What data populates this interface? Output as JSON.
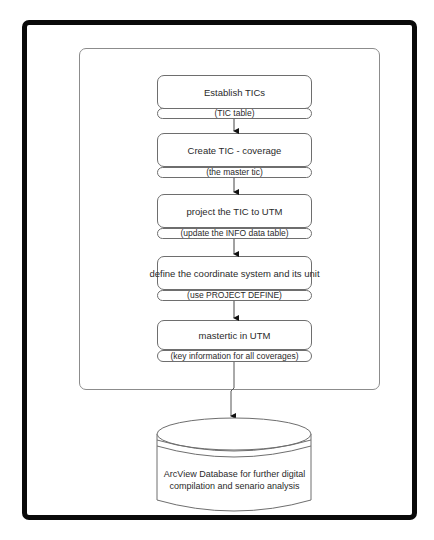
{
  "diagram": {
    "type": "flowchart",
    "steps": [
      {
        "title": "Establish TICs",
        "label": "(TIC table)"
      },
      {
        "title": "Create TIC - coverage",
        "label": "(the master tic)"
      },
      {
        "title": "project  the TIC to UTM",
        "label": "(update the INFO data table)"
      },
      {
        "title": "define the coordinate system  and its unit",
        "label": "(use PROJECT DEFINE)"
      },
      {
        "title": "mastertic in UTM",
        "label": "(key information for all coverages)"
      }
    ],
    "database": {
      "shape": "cylinder",
      "line1": "ArcView Database for further digital",
      "line2": "compilation and senario analysis"
    },
    "colors": {
      "outer_frame": "#0a0a0a",
      "inner_frame": "#8c8c8c",
      "box_border": "#6e6e6e",
      "text": "#2a2a2a",
      "arrow": "#111111"
    }
  }
}
